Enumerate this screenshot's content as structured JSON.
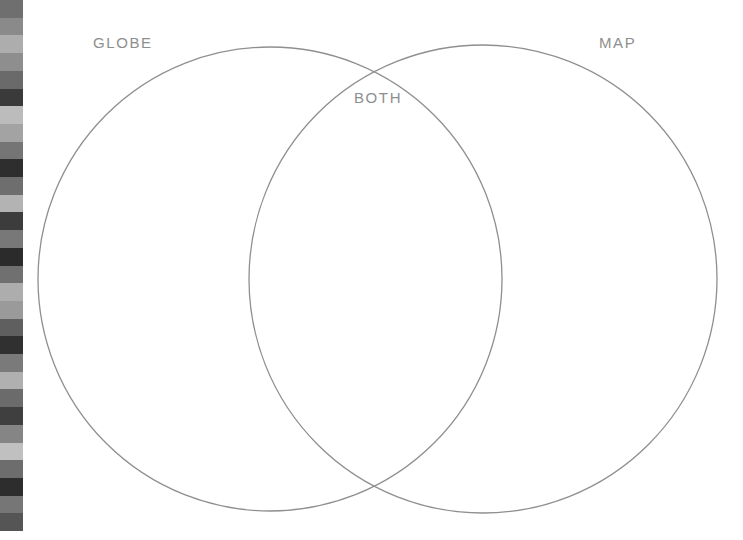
{
  "page": {
    "width": 743,
    "height": 540,
    "background_color": "#ffffff",
    "type": "venn-diagram-worksheet"
  },
  "diagram": {
    "title_left": "GLOBE",
    "title_right": "MAP",
    "title_overlap": "BOTH",
    "stroke_color": "#8f8f8f",
    "label_color": "#8e8e8e",
    "fill": "none",
    "left_circle": {
      "cx": 270,
      "cy": 279,
      "r": 232
    },
    "right_circle": {
      "cx": 483,
      "cy": 279,
      "r": 234
    }
  },
  "calibration_strip": {
    "name": "grayscale-calibration-bars",
    "x": 0,
    "y": 0,
    "width": 23,
    "height": 531,
    "swatches": [
      "#6f6f6f",
      "#8a8a8a",
      "#adadad",
      "#8e8e8e",
      "#6a6a6a",
      "#3a3a3a",
      "#bcbcbc",
      "#a3a3a3",
      "#757575",
      "#2e2e2e",
      "#6e6e6e",
      "#b3b3b3",
      "#3c3c3c",
      "#787878",
      "#2b2b2b",
      "#707070",
      "#adadad",
      "#9a9a9a",
      "#5f5f5f",
      "#303030",
      "#7a7a7a",
      "#b0b0b0",
      "#6b6b6b",
      "#3f3f3f",
      "#858585",
      "#c0c0c0",
      "#6d6d6d",
      "#2d2d2d",
      "#767676",
      "#555555"
    ]
  }
}
